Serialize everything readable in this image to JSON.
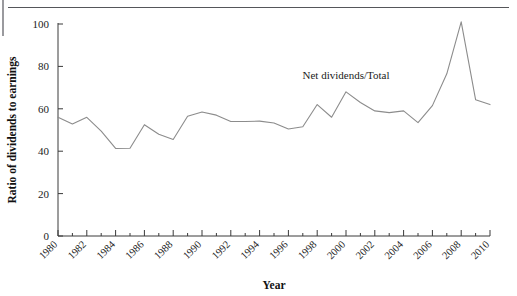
{
  "figure": {
    "background_color": "#ffffff",
    "rule_color": "#55565a",
    "left_mark_color": "#9a9a9e"
  },
  "chart_data": {
    "type": "line",
    "title": "",
    "subtitle": "",
    "xlabel": "Year",
    "ylabel": "Ratio of dividends to earnings",
    "xlim": [
      1980,
      2010
    ],
    "ylim": [
      0,
      100
    ],
    "grid": false,
    "legend_position": "inline-annotation",
    "line_color": "#8c8c8c",
    "x_tick_labels": [
      "1980",
      "1982",
      "1984",
      "1986",
      "1988",
      "1990",
      "1992",
      "1994",
      "1996",
      "1998",
      "2000",
      "2002",
      "2004",
      "2006",
      "2008",
      "2010"
    ],
    "x_tick_values": [
      1980,
      1982,
      1984,
      1986,
      1988,
      1990,
      1992,
      1994,
      1996,
      1998,
      2000,
      2002,
      2004,
      2006,
      2008,
      2010
    ],
    "y_tick_labels": [
      "0",
      "20",
      "40",
      "60",
      "80",
      "100"
    ],
    "y_tick_values": [
      0,
      20,
      40,
      60,
      80,
      100
    ],
    "x": [
      1980,
      1981,
      1982,
      1983,
      1984,
      1985,
      1986,
      1987,
      1988,
      1989,
      1990,
      1991,
      1992,
      1993,
      1994,
      1995,
      1996,
      1997,
      1998,
      1999,
      2000,
      2001,
      2002,
      2003,
      2004,
      2005,
      2006,
      2007,
      2008,
      2009,
      2010
    ],
    "series": [
      {
        "name": "Net dividends/Total",
        "annotation": "Net dividends/Total",
        "annotation_x": 2000,
        "annotation_y": 74,
        "values": [
          56.0,
          52.8,
          56.0,
          49.5,
          41.3,
          41.4,
          52.5,
          48.0,
          45.5,
          56.5,
          58.5,
          57.0,
          54.0,
          54.0,
          54.2,
          53.3,
          50.5,
          51.5,
          62.0,
          56.0,
          68.0,
          63.0,
          59.0,
          58.2,
          59.0,
          53.5,
          61.5,
          76.5,
          101.0,
          64.3,
          62.0
        ]
      }
    ]
  },
  "annotations": {
    "series_label": "Net dividends/Total"
  },
  "axis": {
    "x_title": "Year",
    "y_title": "Ratio of dividends to earnings"
  }
}
